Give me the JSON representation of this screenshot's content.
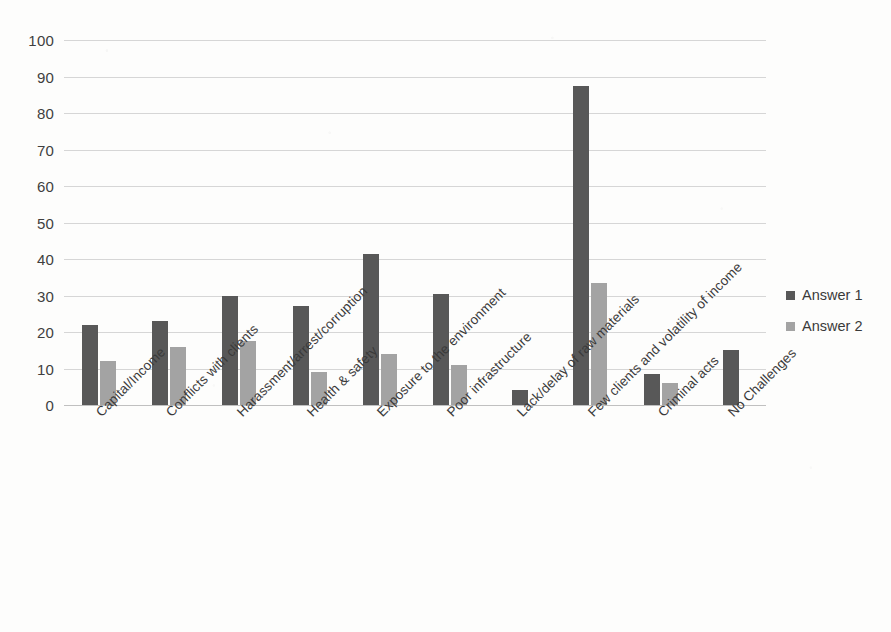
{
  "chart_data": {
    "type": "bar",
    "title": "",
    "xlabel": "",
    "ylabel": "",
    "ylim": [
      0,
      100
    ],
    "ytick_step": 10,
    "yticks": [
      100,
      90,
      80,
      70,
      60,
      50,
      40,
      30,
      20,
      10,
      0
    ],
    "grid": true,
    "legend_position": "right",
    "categories": [
      "Capital/Income",
      "Conflicts with clients",
      "Harassment/arrest/corruption",
      "Health & safety",
      "Exposure to the environment",
      "Poor infrastructure",
      "Lack/delay of raw materials",
      "Few clients and volatility of income",
      "Criminal acts",
      "No Challenges"
    ],
    "series": [
      {
        "name": "Answer 1",
        "color": "#585858",
        "values": [
          22,
          23,
          30,
          27,
          41.5,
          30.5,
          4,
          87.5,
          8.5,
          15
        ]
      },
      {
        "name": "Answer 2",
        "color": "#a3a3a3",
        "values": [
          12,
          16,
          17.5,
          9,
          14,
          11,
          0,
          33.5,
          6,
          0
        ]
      }
    ]
  },
  "legend": {
    "items": [
      {
        "label": "Answer 1",
        "swatch": "legend-swatch-answer-1"
      },
      {
        "label": "Answer 2",
        "swatch": "legend-swatch-answer-2"
      }
    ]
  }
}
